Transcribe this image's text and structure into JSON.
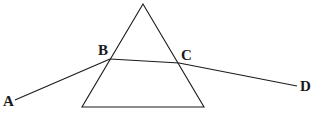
{
  "diagram": {
    "prism": {
      "apex": [
        143,
        4
      ],
      "bottom_left": [
        82,
        107
      ],
      "bottom_right": [
        204,
        107
      ]
    },
    "ray": {
      "points": {
        "A": [
          15,
          100
        ],
        "B": [
          110,
          59
        ],
        "C": [
          179,
          63
        ],
        "D": [
          297,
          86
        ]
      }
    },
    "labels": {
      "A": "A",
      "B": "B",
      "C": "C",
      "D": "D"
    },
    "colors": {
      "line": "#1a1a1a",
      "background": "#ffffff"
    }
  }
}
